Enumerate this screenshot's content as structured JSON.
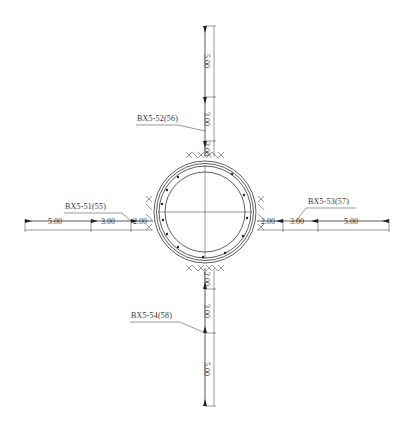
{
  "drawing": {
    "type": "anchor bolt layout around circular tunnel section",
    "stroke_color": "#333333",
    "background": "#ffffff"
  },
  "labels": {
    "top": "BX5-52(56)",
    "left": "BX5-51(55)",
    "right": "BX5-53(57)",
    "bottom": "BX5-54(58)"
  },
  "dimensions": {
    "top": [
      "5.00",
      "3.00",
      "2.00"
    ],
    "left": [
      "5.00",
      "3.00",
      "2.00"
    ],
    "right": [
      "2.00",
      "3.00",
      "5.00"
    ],
    "bottom": [
      "2.00",
      "3.00",
      "5.00"
    ]
  }
}
